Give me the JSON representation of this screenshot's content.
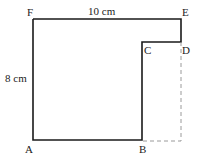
{
  "diagram": {
    "points": {
      "A": {
        "label": "A"
      },
      "B": {
        "label": "B"
      },
      "C": {
        "label": "C"
      },
      "D": {
        "label": "D"
      },
      "E": {
        "label": "E"
      },
      "F": {
        "label": "F"
      }
    },
    "dimensions": {
      "top": "10 cm",
      "left": "8 cm"
    },
    "colors": {
      "solid": "#1a1a1a",
      "dashed": "#9a9a9a"
    }
  }
}
